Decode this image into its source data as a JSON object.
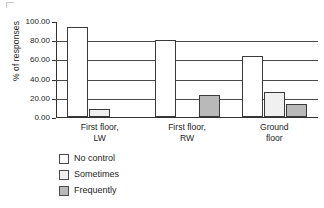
{
  "chart_data": {
    "type": "bar",
    "title": "",
    "xlabel": "",
    "ylabel": "% of responses",
    "ylim": [
      0,
      100
    ],
    "ytick_labels": [
      "100.00",
      "80.00",
      "60.00",
      "40.00",
      "20.00",
      "0.00"
    ],
    "ytick_values": [
      100,
      80,
      60,
      40,
      20,
      0
    ],
    "grid": true,
    "grid_axis": "y",
    "legend_position": "below-left",
    "categories": [
      "First floor, LW",
      "First floor, RW",
      "Ground floor"
    ],
    "category_lines": [
      [
        "First floor,",
        "LW"
      ],
      [
        "First floor,",
        "RW"
      ],
      [
        "Ground",
        "floor"
      ]
    ],
    "series": [
      {
        "name": "No control",
        "color": "#ffffff",
        "values": [
          94,
          80,
          64
        ]
      },
      {
        "name": "Sometimes",
        "color": "#f0f0f0",
        "values": [
          8,
          0,
          26
        ]
      },
      {
        "name": "Frequently",
        "color": "#b9b9b9",
        "values": [
          0,
          23,
          14
        ]
      }
    ]
  },
  "axis": {
    "line_color": "#333333",
    "grid_color": "#4a4a4a"
  },
  "legend": {
    "items": [
      {
        "label": "No control",
        "color": "#ffffff"
      },
      {
        "label": "Sometimes",
        "color": "#f0f0f0"
      },
      {
        "label": "Frequently",
        "color": "#b9b9b9"
      }
    ]
  }
}
